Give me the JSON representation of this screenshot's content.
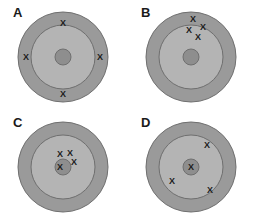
{
  "figure": {
    "title": "",
    "background_color": "#ffffff",
    "panel_count": 4
  },
  "style": {
    "outer_ring_color": "#9a9a9a",
    "middle_ring_color": "#b4b4b4",
    "bullseye_color": "#8e8e8e",
    "stroke_color": "#6f6f6f",
    "mark_color": "#1c1c1c",
    "label_color": "#1a1a1a",
    "mark_glyph": "X"
  },
  "geometry": {
    "outer_radius": 45,
    "middle_radius": 32,
    "bullseye_radius": 8
  },
  "panels": [
    {
      "label": "A",
      "name": "panel-a",
      "origin": {
        "x": 0,
        "y": 0
      },
      "center": {
        "x": 63,
        "y": 57
      },
      "marks": [
        {
          "x": 63,
          "y": 23,
          "ring": "middle-edge-top"
        },
        {
          "x": 26,
          "y": 57,
          "ring": "outer-left"
        },
        {
          "x": 100,
          "y": 57,
          "ring": "outer-right"
        },
        {
          "x": 63,
          "y": 94,
          "ring": "outer-bottom"
        }
      ]
    },
    {
      "label": "B",
      "name": "panel-b",
      "origin": {
        "x": 128,
        "y": 0
      },
      "center": {
        "x": 63,
        "y": 57
      },
      "marks": [
        {
          "x": 65,
          "y": 19,
          "ring": "outer-top"
        },
        {
          "x": 75,
          "y": 27,
          "ring": "outer-top"
        },
        {
          "x": 61,
          "y": 30,
          "ring": "middle-edge-top"
        },
        {
          "x": 70,
          "y": 37,
          "ring": "middle-top"
        }
      ]
    },
    {
      "label": "C",
      "name": "panel-c",
      "origin": {
        "x": 0,
        "y": 110
      },
      "center": {
        "x": 63,
        "y": 57
      },
      "marks": [
        {
          "x": 60,
          "y": 44,
          "ring": "middle-near-center"
        },
        {
          "x": 70,
          "y": 43,
          "ring": "middle-near-center"
        },
        {
          "x": 74,
          "y": 52,
          "ring": "middle-near-center"
        },
        {
          "x": 60,
          "y": 57,
          "ring": "bullseye"
        }
      ]
    },
    {
      "label": "D",
      "name": "panel-d",
      "origin": {
        "x": 128,
        "y": 110
      },
      "center": {
        "x": 63,
        "y": 57
      },
      "marks": [
        {
          "x": 79,
          "y": 35,
          "ring": "middle-upper-right"
        },
        {
          "x": 63,
          "y": 57,
          "ring": "bullseye"
        },
        {
          "x": 44,
          "y": 71,
          "ring": "middle-lower-left"
        },
        {
          "x": 82,
          "y": 80,
          "ring": "middle-lower-right"
        }
      ]
    }
  ]
}
